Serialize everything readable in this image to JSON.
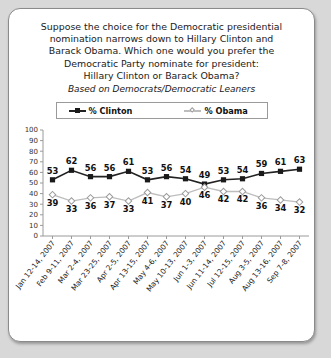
{
  "card": {
    "title_lines": [
      "Suppose the choice for the Democratic presidential",
      "nomination narrows down to Hillary Clinton and",
      "Barack Obama. Which one would you prefer the",
      "Democratic Party nominate for president:",
      "Hillary Clinton or Barack Obama?"
    ],
    "subtitle": "Based on Democrats/Democratic Leaners"
  },
  "legend": {
    "clinton_label": "% Clinton",
    "obama_label": "% Obama"
  },
  "chart_data": {
    "type": "line",
    "subtitle": "Based on Democrats/Democratic Leaners",
    "xlabel": "",
    "ylabel": "",
    "ylim": [
      0,
      100
    ],
    "yticks": [
      0,
      10,
      20,
      30,
      40,
      50,
      60,
      70,
      80,
      90,
      100
    ],
    "ytick_labels": [
      "0",
      "10",
      "20",
      "30",
      "40",
      "50",
      "60",
      "70",
      "80",
      "90",
      "100"
    ],
    "grid": false,
    "legend_position": "top",
    "categories": [
      "Jan 12-14, 2007",
      "Feb 9-11, 2007",
      "Mar 2-4, 2007",
      "Mar 23-25, 2007",
      "Apr 2-5, 2007",
      "Apr 13-15, 2007",
      "May 4-6, 2007",
      "May 10-13, 2007",
      "Jun 1-3, 2007",
      "Jun 11-14, 2007",
      "Jul 12-15, 2007",
      "Aug 3-5, 2007",
      "Aug 13-16, 2007",
      "Sep 7-8, 2007"
    ],
    "series": [
      {
        "name": "% Clinton",
        "color": "#222222",
        "marker": "filled-square",
        "values": [
          53,
          62,
          56,
          56,
          61,
          53,
          56,
          54,
          49,
          53,
          54,
          59,
          61,
          63
        ]
      },
      {
        "name": "% Obama",
        "color": "#bdbdbd",
        "marker": "open-diamond",
        "values": [
          39,
          33,
          36,
          37,
          33,
          41,
          37,
          40,
          46,
          42,
          42,
          36,
          34,
          32
        ]
      }
    ]
  }
}
